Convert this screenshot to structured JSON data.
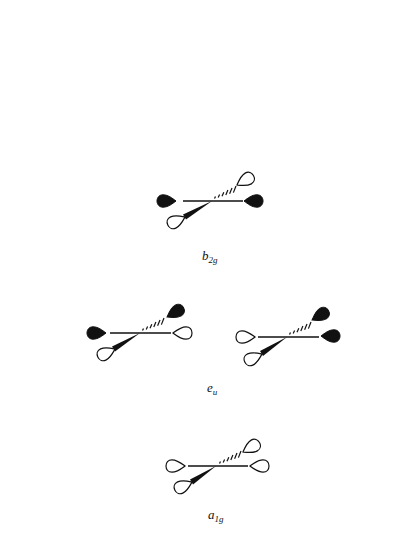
{
  "figure": {
    "colors": {
      "ink": "#111111",
      "background": "#ffffff",
      "positive_lobe_fill": "#111111",
      "negative_lobe_fill": "#ffffff"
    },
    "diagrams": [
      {
        "id": "b2g",
        "label_main": "b",
        "label_sub": "2g",
        "lobes": {
          "left": "filled",
          "right": "filled",
          "front_left": "open",
          "back_right": "open"
        }
      },
      {
        "id": "eu_1",
        "label_main": "e",
        "label_sub": "u",
        "lobes": {
          "left": "filled",
          "right": "open",
          "front_left": "open",
          "back_right": "filled"
        }
      },
      {
        "id": "eu_2",
        "lobes": {
          "left": "open",
          "right": "filled",
          "front_left": "open",
          "back_right": "filled"
        }
      },
      {
        "id": "a1g",
        "label_main": "a",
        "label_sub": "1g",
        "lobes": {
          "left": "open",
          "right": "open",
          "front_left": "open",
          "back_right": "open"
        }
      }
    ]
  }
}
